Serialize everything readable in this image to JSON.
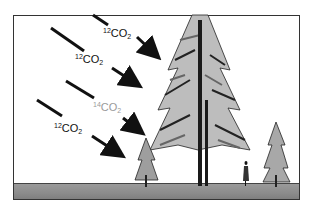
{
  "diagram": {
    "labels": [
      {
        "id": "co2-12-top",
        "isotope": "12",
        "molecule": "CO",
        "subscript": "2",
        "color": "#111111"
      },
      {
        "id": "co2-12-second",
        "isotope": "12",
        "molecule": "CO",
        "subscript": "2",
        "color": "#111111"
      },
      {
        "id": "co2-14",
        "isotope": "14",
        "molecule": "CO",
        "subscript": "2",
        "color": "#9a9a9a"
      },
      {
        "id": "co2-12-bottom",
        "isotope": "12",
        "molecule": "CO",
        "subscript": "2",
        "color": "#111111"
      }
    ],
    "scene": {
      "elements": [
        "large-tree",
        "small-tree-left",
        "small-tree-right",
        "person",
        "ground"
      ],
      "arrows": 4
    }
  }
}
